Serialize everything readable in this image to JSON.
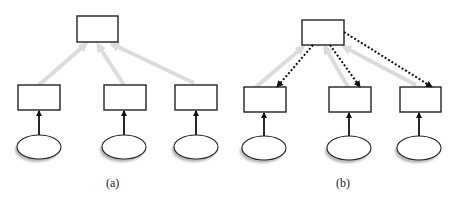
{
  "panels": [
    {
      "id": "a",
      "label": "(a)",
      "label_pos": [
        112,
        186
      ],
      "top_node": {
        "x": 77,
        "y": 16,
        "w": 41,
        "h": 26
      },
      "mid_nodes": [
        {
          "x": 18,
          "y": 85,
          "w": 42,
          "h": 25
        },
        {
          "x": 104,
          "y": 85,
          "w": 42,
          "h": 25
        },
        {
          "x": 175,
          "y": 85,
          "w": 42,
          "h": 25
        }
      ],
      "leaf_nodes": [
        {
          "cx": 39,
          "cy": 147,
          "rx": 22,
          "ry": 12
        },
        {
          "cx": 124,
          "cy": 147,
          "rx": 22,
          "ry": 12
        },
        {
          "cx": 196,
          "cy": 147,
          "rx": 22,
          "ry": 12
        }
      ],
      "gray_arrows": [
        {
          "from": [
            39,
            85
          ],
          "to": [
            86,
            44
          ]
        },
        {
          "from": [
            124,
            85
          ],
          "to": [
            98,
            45
          ]
        },
        {
          "from": [
            194,
            83
          ],
          "to": [
            112,
            44
          ]
        }
      ],
      "dotted_arrows": []
    },
    {
      "id": "b",
      "label": "(b)",
      "label_pos": [
        342,
        186
      ],
      "top_node": {
        "x": 302,
        "y": 20,
        "w": 42,
        "h": 25
      },
      "mid_nodes": [
        {
          "x": 244,
          "y": 87,
          "w": 42,
          "h": 25
        },
        {
          "x": 329,
          "y": 87,
          "w": 42,
          "h": 25
        },
        {
          "x": 400,
          "y": 87,
          "w": 41,
          "h": 25
        }
      ],
      "leaf_nodes": [
        {
          "cx": 264,
          "cy": 148,
          "rx": 22,
          "ry": 12
        },
        {
          "cx": 349,
          "cy": 148,
          "rx": 22,
          "ry": 12
        },
        {
          "cx": 419,
          "cy": 148,
          "rx": 22,
          "ry": 12
        }
      ],
      "gray_arrows": [
        {
          "from": [
            256,
            87
          ],
          "to": [
            303,
            47
          ]
        },
        {
          "from": [
            348,
            87
          ],
          "to": [
            325,
            47
          ]
        },
        {
          "from": [
            416,
            85
          ],
          "to": [
            344,
            47
          ]
        }
      ],
      "dotted_arrows": [
        {
          "from": [
            313,
            45
          ],
          "to": [
            277,
            87
          ]
        },
        {
          "from": [
            330,
            45
          ],
          "to": [
            360,
            87
          ]
        },
        {
          "from": [
            344,
            32
          ],
          "to": [
            432,
            87
          ]
        }
      ]
    }
  ],
  "colors": {
    "stroke": "#222222",
    "gray_arrow": "#dcdcdc",
    "shadow": "#b8b8b8"
  }
}
